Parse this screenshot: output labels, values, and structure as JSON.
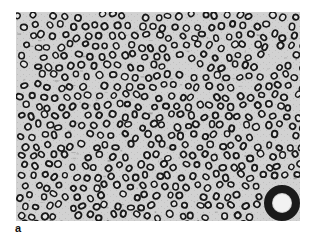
{
  "figure": {
    "panel_label": "a",
    "colors": {
      "background": "#cfcfcf",
      "rings": "#1a1a1a",
      "page": "#ffffff"
    }
  }
}
